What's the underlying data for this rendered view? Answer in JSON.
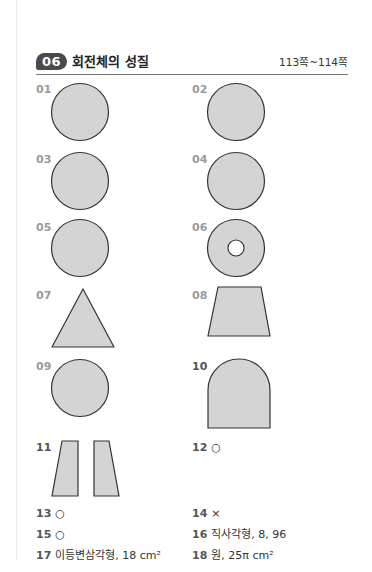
{
  "header": {
    "section_number": "06",
    "title": "회전체의 성질",
    "pages": "113쪽~114쪽"
  },
  "figure_items": [
    {
      "num": "01",
      "shape": "circle"
    },
    {
      "num": "02",
      "shape": "circle"
    },
    {
      "num": "03",
      "shape": "circle"
    },
    {
      "num": "04",
      "shape": "circle"
    },
    {
      "num": "05",
      "shape": "circle"
    },
    {
      "num": "06",
      "shape": "annulus"
    },
    {
      "num": "07",
      "shape": "triangle"
    },
    {
      "num": "08",
      "shape": "trapezoid"
    },
    {
      "num": "09",
      "shape": "circle"
    },
    {
      "num": "10",
      "shape": "rounded-top-rectangle"
    },
    {
      "num": "11",
      "shape": "two-trapezoids"
    }
  ],
  "text_answers": [
    {
      "num": "12",
      "text": "○"
    },
    {
      "num": "13",
      "text": "○"
    },
    {
      "num": "14",
      "text": "×"
    },
    {
      "num": "15",
      "text": "○"
    },
    {
      "num": "16",
      "text": "직사각형, 8, 96"
    },
    {
      "num": "17",
      "text": "이등변삼각형, 18 cm²"
    },
    {
      "num": "18",
      "text": "원, 25π cm²"
    }
  ],
  "colors": {
    "shape_fill": "#d4d4d4",
    "shape_stroke": "#333333",
    "badge": "#4a4a4a"
  }
}
